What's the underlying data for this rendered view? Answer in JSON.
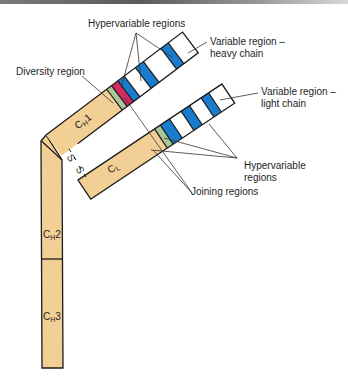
{
  "diagram": {
    "colors": {
      "constant": "#f2cf95",
      "diversity": "#d42a63",
      "joining": "#a9c89a",
      "hypervariable": "#1a7ccc",
      "variable": "#ffffff",
      "outline": "#1b1b1b"
    },
    "labels": {
      "hypervariable_top": "Hypervariable regions",
      "variable_heavy_line1": "Variable region –",
      "variable_heavy_line2": "heavy chain",
      "diversity": "Diversity region",
      "variable_light_line1": "Variable region –",
      "variable_light_line2": "light chain",
      "hypervariable_bottom_line1": "Hypervariable",
      "hypervariable_bottom_line2": "regions",
      "joining": "Joining regions",
      "disulfide": "S–S"
    },
    "domains": {
      "ch1": {
        "base": "C",
        "sub": "H",
        "suffix": "1"
      },
      "ch2": {
        "base": "C",
        "sub": "H",
        "suffix": "2"
      },
      "ch3": {
        "base": "C",
        "sub": "H",
        "suffix": "3"
      },
      "cl": {
        "base": "C",
        "sub": "L",
        "suffix": ""
      }
    },
    "heavy_chain_segments": [
      "constant CH1",
      "joining",
      "diversity",
      "hypervariable",
      "variable",
      "hypervariable",
      "variable",
      "hypervariable",
      "variable"
    ],
    "light_chain_segments": [
      "constant CL",
      "joining",
      "hypervariable",
      "variable",
      "hypervariable",
      "variable",
      "hypervariable",
      "variable"
    ]
  }
}
